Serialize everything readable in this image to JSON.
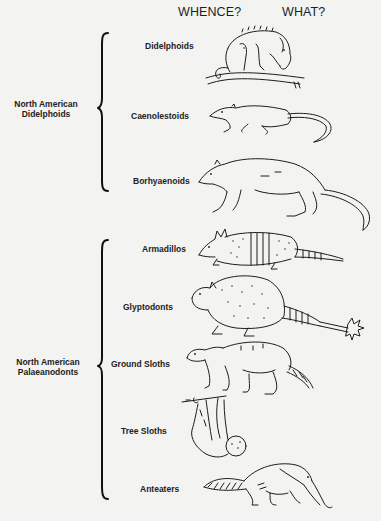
{
  "headers": {
    "whence": "WHENCE?",
    "what": "WHAT?"
  },
  "groups": [
    {
      "id": "didelphoids",
      "label_line1": "North  American",
      "label_line2": "Didelphoids",
      "taxa": [
        {
          "label": "Didelphoids",
          "icon": "opossum-drawing"
        },
        {
          "label": "Caenolestoids",
          "icon": "shrew-opossum-drawing"
        },
        {
          "label": "Borhyaenoids",
          "icon": "borhyaenid-drawing"
        }
      ]
    },
    {
      "id": "palaeanodonts",
      "label_line1": "North  American",
      "label_line2": "Palaeanodonts",
      "taxa": [
        {
          "label": "Armadillos",
          "icon": "armadillo-drawing"
        },
        {
          "label": "Glyptodonts",
          "icon": "glyptodont-drawing"
        },
        {
          "label": "Ground  Sloths",
          "icon": "ground-sloth-drawing"
        },
        {
          "label": "Tree  Sloths",
          "icon": "tree-sloth-drawing"
        },
        {
          "label": "Anteaters",
          "icon": "anteater-drawing"
        }
      ]
    }
  ],
  "colors": {
    "background": "#f3f3f1",
    "ink": "#1c1c1c"
  }
}
